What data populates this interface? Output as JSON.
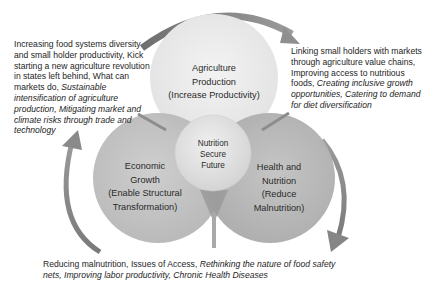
{
  "diagram": {
    "type": "venn-cycle",
    "colors": {
      "circle_top": "#ececec",
      "circle_left": "#c4c4c4",
      "circle_right": "#b9b9b9",
      "circle_center": "#e1e1e1",
      "arrow": "#8a8a8a",
      "text": "#1e1e1e"
    },
    "circles": {
      "top": {
        "line1": "Agriculture",
        "line2": "Production",
        "line3": "(Increase Productivity)"
      },
      "left": {
        "line1": "Economic",
        "line2": "Growth",
        "line3": "(Enable Structural",
        "line4": "Transformation)"
      },
      "right": {
        "line1": "Health and",
        "line2": "Nutrition",
        "line3": "(Reduce",
        "line4": "Malnutrition)"
      },
      "center": {
        "line1": "Nutrition",
        "line2": "Secure",
        "line3": "Future"
      }
    },
    "notes": {
      "left": {
        "normal": "Increasing food systems diversity and small holder productivity, Kick starting a new agriculture revolution in states left behind, What can markets do, ",
        "italic": "Sustainable intensification of agriculture production, Mitigating market and climate risks through trade and technology"
      },
      "right": {
        "normal": "Linking small holders with markets through agriculture value chains, Improving access to nutritious foods, ",
        "italic": "Creating inclusive growth opportunities, Catering to demand for diet diversification"
      },
      "bottom": {
        "normal": "Reducing malnutrition, Issues of Access, ",
        "italic": "Rethinking the nature of food safety nets, Improving labor productivity, Chronic Health Diseases"
      }
    },
    "arrows": [
      {
        "from": "left-note",
        "to": "right-note",
        "position": "top",
        "direction": "clockwise"
      },
      {
        "from": "right-note",
        "to": "bottom-note",
        "position": "right",
        "direction": "clockwise"
      },
      {
        "from": "bottom-note",
        "to": "left-note",
        "position": "left",
        "direction": "clockwise"
      }
    ]
  }
}
